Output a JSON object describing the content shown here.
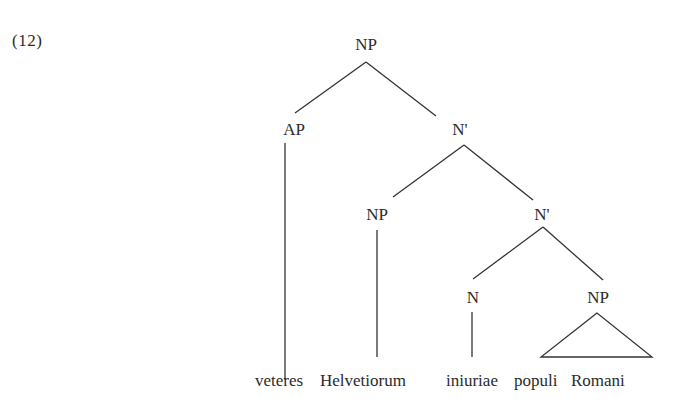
{
  "example": {
    "number": "(12)"
  },
  "tree": {
    "root": {
      "label": "NP"
    },
    "level1": {
      "left": {
        "label": "AP"
      },
      "right": {
        "label": "N'"
      }
    },
    "level2": {
      "left": {
        "label": "NP"
      },
      "right": {
        "label": "N'"
      }
    },
    "level3": {
      "left": {
        "label": "N"
      },
      "right": {
        "label": "NP",
        "rendering": "triangle"
      }
    },
    "leaves": [
      {
        "word": "veteres",
        "attached_to": "AP"
      },
      {
        "word": "Helvetiorum",
        "attached_to": "NP"
      },
      {
        "word": "iniuriae",
        "attached_to": "N"
      },
      {
        "word": "populi",
        "attached_to": "NP (triangle)"
      },
      {
        "word": "Romani",
        "attached_to": "NP (triangle)"
      }
    ]
  },
  "colors": {
    "text": "#2b2b2b",
    "lines": "#333333",
    "background": "#ffffff"
  }
}
